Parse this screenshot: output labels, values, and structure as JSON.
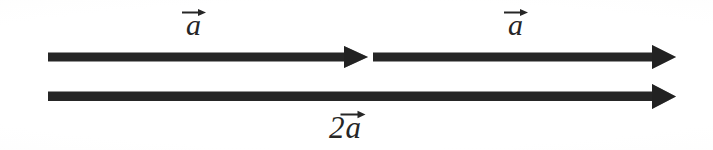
{
  "figure": {
    "background_color": "#fefefe",
    "ink_color": "#262626",
    "width": 713,
    "height": 150
  },
  "labels": {
    "first_vector": {
      "coefficient": "",
      "symbol": "a",
      "accent": "right-arrow"
    },
    "second_vector": {
      "coefficient": "",
      "symbol": "a",
      "accent": "right-arrow"
    },
    "resultant_vector": {
      "coefficient": "2",
      "symbol": "a",
      "accent": "right-arrow"
    }
  },
  "arrows": {
    "top_first": {
      "name": "vector-a-first",
      "x_start": 48,
      "x_tip": 368,
      "y_center": 57
    },
    "top_second": {
      "name": "vector-a-second",
      "x_start": 373,
      "x_tip": 676,
      "y_center": 57
    },
    "bottom": {
      "name": "vector-2a",
      "x_start": 48,
      "x_tip": 676,
      "y_center": 96
    }
  }
}
